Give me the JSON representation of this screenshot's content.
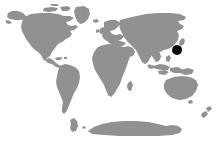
{
  "figure": {
    "kind": "world-distribution-map",
    "width": 220,
    "height": 146,
    "background_color": "#ffffff",
    "land_color": "#919191",
    "marker_color": "#0a0a0a",
    "projection": "equirectangular-world",
    "alt_text": "World map with a black marker over Japan"
  },
  "marker": {
    "label": "Japan",
    "shape": "filled-circle",
    "color": "#0a0a0a",
    "x_px": 177,
    "y_px": 50,
    "radius_px": 5
  },
  "landmasses": [
    {
      "name": "North America"
    },
    {
      "name": "Greenland"
    },
    {
      "name": "South America"
    },
    {
      "name": "Europe"
    },
    {
      "name": "Africa"
    },
    {
      "name": "Asia"
    },
    {
      "name": "Australia"
    },
    {
      "name": "New Zealand"
    },
    {
      "name": "Antarctica"
    },
    {
      "name": "Japan"
    },
    {
      "name": "Madagascar"
    },
    {
      "name": "Indonesia"
    },
    {
      "name": "Philippines"
    },
    {
      "name": "British Isles"
    },
    {
      "name": "Iceland"
    },
    {
      "name": "Sri Lanka"
    }
  ]
}
